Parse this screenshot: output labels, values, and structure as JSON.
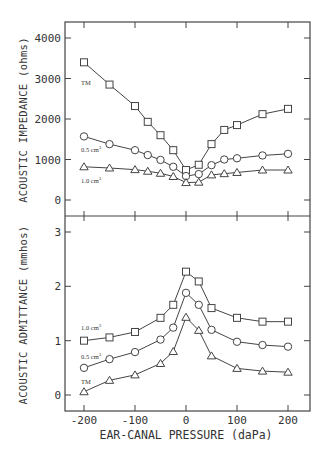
{
  "chart_data": [
    {
      "type": "line",
      "title": "",
      "xlabel": "EAR-CANAL PRESSURE (daPa)",
      "ylabel": "ACOUSTIC IMPEDANCE (ohms)",
      "ylim": [
        -400,
        4400
      ],
      "yticks": [
        0,
        1000,
        2000,
        3000,
        4000
      ],
      "x": [
        -200,
        -150,
        -100,
        -75,
        -50,
        -25,
        0,
        25,
        50,
        75,
        100,
        150,
        200
      ],
      "series": [
        {
          "name": "TM",
          "marker": "square",
          "values": [
            3400,
            2850,
            2320,
            1930,
            1600,
            1230,
            740,
            870,
            1380,
            1730,
            1850,
            2120,
            2250
          ]
        },
        {
          "name": "0.5 cm3",
          "marker": "circle",
          "values": [
            1570,
            1380,
            1230,
            1110,
            990,
            820,
            590,
            640,
            860,
            1000,
            1030,
            1100,
            1140
          ]
        },
        {
          "name": "1.0 cm3",
          "marker": "triangle",
          "values": [
            820,
            790,
            750,
            710,
            660,
            580,
            430,
            440,
            620,
            650,
            680,
            740,
            740
          ]
        }
      ]
    },
    {
      "type": "line",
      "title": "",
      "xlabel": "EAR-CANAL PRESSURE (daPa)",
      "ylabel": "ACOUSTIC ADMITTANCE (mmhos)",
      "ylim": [
        -0.3,
        3.3
      ],
      "yticks": [
        0,
        1,
        2,
        3
      ],
      "xticks": [
        -200,
        -100,
        0,
        100,
        200
      ],
      "x": [
        -200,
        -150,
        -100,
        -50,
        -25,
        0,
        25,
        50,
        100,
        150,
        200
      ],
      "series": [
        {
          "name": "1.0 cm3",
          "marker": "square",
          "values": [
            1.0,
            1.06,
            1.16,
            1.42,
            1.66,
            2.27,
            2.09,
            1.6,
            1.42,
            1.35,
            1.35
          ]
        },
        {
          "name": "0.5 cm3",
          "marker": "circle",
          "values": [
            0.5,
            0.66,
            0.79,
            1.02,
            1.24,
            1.88,
            1.66,
            1.2,
            0.98,
            0.92,
            0.89
          ]
        },
        {
          "name": "TM",
          "marker": "triangle",
          "values": [
            0.06,
            0.27,
            0.37,
            0.58,
            0.8,
            1.43,
            1.19,
            0.72,
            0.49,
            0.44,
            0.42
          ]
        }
      ]
    }
  ],
  "labels": {
    "top_ylabel": "ACOUSTIC IMPEDANCE (ohms)",
    "bottom_ylabel": "ACOUSTIC ADMITTANCE (mmhos)",
    "xlabel": "EAR-CANAL PRESSURE (daPa)",
    "top_series": [
      "TM",
      "0.5 cm",
      "1.0 cm"
    ],
    "bottom_series": [
      "1.0 cm",
      "0.5 cm",
      "TM"
    ],
    "sup": "3"
  },
  "ticks": {
    "top_y": [
      "0",
      "1000",
      "2000",
      "3000",
      "4000"
    ],
    "bottom_y": [
      "0",
      "1",
      "2",
      "3"
    ],
    "x": [
      "-200",
      "-100",
      "0",
      "100",
      "200"
    ]
  }
}
